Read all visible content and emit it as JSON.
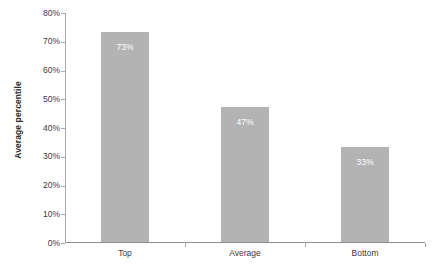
{
  "chart_data": {
    "type": "bar",
    "title": "",
    "subtitle": "",
    "xlabel": "",
    "ylabel": "Average percentile",
    "categories": [
      "Top",
      "Average",
      "Bottom"
    ],
    "values": [
      73,
      47,
      33
    ],
    "value_labels": [
      "73%",
      "47%",
      "33%"
    ],
    "ylim": [
      0,
      80
    ],
    "y_tick_values": [
      0,
      10,
      20,
      30,
      40,
      50,
      60,
      70,
      80
    ],
    "y_tick_labels": [
      "0%",
      "10%",
      "20%",
      "30%",
      "40%",
      "50%",
      "60%",
      "70%",
      "80%"
    ],
    "grid": false,
    "legend": false,
    "legend_position": "none",
    "series": [
      {
        "name": "Average percentile",
        "values": [
          73,
          47,
          33
        ]
      }
    ],
    "colors": {
      "bar_fill": "#b3b3b3",
      "value_label": "#ffffff",
      "axis_line": "#a9a9a9",
      "tick_text": "#3a3a3a",
      "axis_title": "#2b2b2b",
      "background": "#ffffff"
    }
  }
}
